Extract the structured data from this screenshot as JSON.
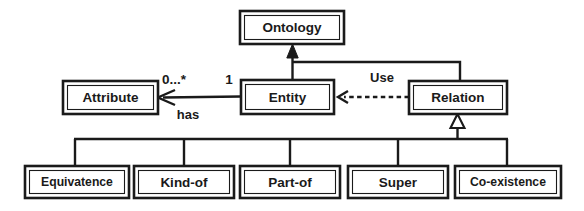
{
  "diagram": {
    "type": "uml-class-diagram",
    "background_color": "#ffffff",
    "line_color": "#1a1a1a",
    "classes": {
      "ontology": {
        "label": "Ontology",
        "x": 240,
        "y": 11,
        "w": 104,
        "h": 33
      },
      "attribute": {
        "label": "Attribute",
        "x": 63,
        "y": 81,
        "w": 95,
        "h": 33
      },
      "entity": {
        "label": "Entity",
        "x": 241,
        "y": 80,
        "w": 93,
        "h": 34
      },
      "relation": {
        "label": "Relation",
        "x": 409,
        "y": 81,
        "w": 98,
        "h": 33
      },
      "equivatence": {
        "label": "Equivatence",
        "x": 25,
        "y": 166,
        "w": 104,
        "h": 32
      },
      "kind_of": {
        "label": "Kind-of",
        "x": 134,
        "y": 166,
        "w": 100,
        "h": 32
      },
      "part_of": {
        "label": "Part-of",
        "x": 240,
        "y": 166,
        "w": 100,
        "h": 32
      },
      "super": {
        "label": "Super",
        "x": 348,
        "y": 166,
        "w": 100,
        "h": 32
      },
      "co_existence": {
        "label": "Co-existence",
        "x": 455,
        "y": 166,
        "w": 106,
        "h": 32
      }
    },
    "relationships": [
      {
        "id": "entity-ontology",
        "kind": "composition-arrow",
        "from": "Entity",
        "to": "Ontology",
        "arrowhead": "solid-triangle",
        "style": "solid"
      },
      {
        "id": "relation-ontology",
        "kind": "composition-arrow",
        "from": "Relation",
        "to": "Ontology",
        "arrowhead": "solid-triangle",
        "style": "solid"
      },
      {
        "id": "entity-attribute",
        "kind": "association",
        "from": "Entity",
        "to": "Attribute",
        "arrowhead": "open-arrow",
        "style": "solid",
        "name": "has",
        "source_multiplicity": "1",
        "target_multiplicity": "0...*"
      },
      {
        "id": "relation-entity",
        "kind": "dependency",
        "from": "Relation",
        "to": "Entity",
        "arrowhead": "open-arrow",
        "style": "dashed",
        "name": "Use"
      },
      {
        "id": "relation-subtypes",
        "kind": "generalization",
        "to": "Relation",
        "arrowhead": "hollow-triangle",
        "style": "solid",
        "from_list": [
          "Equivatence",
          "Kind-of",
          "Part-of",
          "Super",
          "Co-existence"
        ]
      }
    ],
    "edge_labels": {
      "has": "has",
      "use": "Use",
      "mult_target": "0...*",
      "mult_source": "1"
    }
  }
}
